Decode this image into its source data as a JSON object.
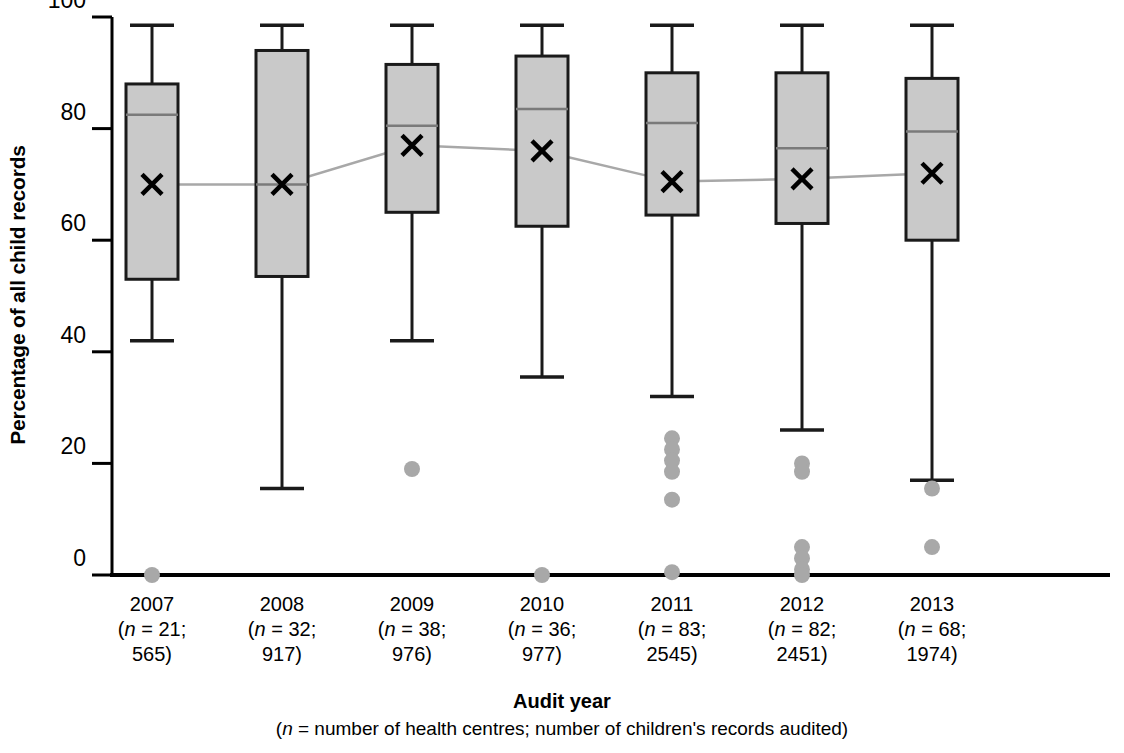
{
  "chart_data": {
    "type": "box",
    "title": "",
    "xlabel": "Audit year",
    "xlabel_note": "(n = number of health centres; number of children's records audited)",
    "ylabel": "Percentage of all child records",
    "ylim": [
      0,
      100
    ],
    "yticks": [
      0,
      20,
      40,
      60,
      80,
      100
    ],
    "ytick_labels": [
      "0",
      "20",
      "40",
      "60",
      "80",
      "100"
    ],
    "grid": false,
    "legend": "none",
    "colors": {
      "box_fill": "#c9c9c9",
      "box_edge": "#1a1a1a",
      "median_line": "#7a7a7a",
      "mean_marker": "#000000",
      "mean_connector": "#a8a8a8",
      "outlier": "#a8a8a8",
      "axis": "#000000"
    },
    "categories": [
      "2007",
      "2008",
      "2009",
      "2010",
      "2011",
      "2012",
      "2013"
    ],
    "category_sublabels": [
      {
        "line1": "(n = 21;",
        "line2": "565)"
      },
      {
        "line1": "(n = 32;",
        "line2": "917)"
      },
      {
        "line1": "(n = 38;",
        "line2": "976)"
      },
      {
        "line1": "(n = 36;",
        "line2": "977)"
      },
      {
        "line1": "(n = 83;",
        "line2": "2545)"
      },
      {
        "line1": "(n = 82;",
        "line2": "2451)"
      },
      {
        "line1": "(n = 68;",
        "line2": "1974)"
      }
    ],
    "health_centres": [
      21,
      32,
      38,
      36,
      83,
      82,
      68
    ],
    "records_audited": [
      565,
      917,
      976,
      977,
      2545,
      2451,
      1974
    ],
    "boxes": [
      {
        "category": "2007",
        "whisker_low": 42,
        "q1": 53,
        "median": 82.5,
        "q3": 88,
        "whisker_high": 98.5,
        "mean": 70,
        "outliers": [
          0
        ]
      },
      {
        "category": "2008",
        "whisker_low": 15.5,
        "q1": 53.5,
        "median": 70,
        "q3": 94,
        "whisker_high": 98.5,
        "mean": 70,
        "outliers": []
      },
      {
        "category": "2009",
        "whisker_low": 42,
        "q1": 65,
        "median": 80.5,
        "q3": 91.5,
        "whisker_high": 98.5,
        "mean": 77,
        "outliers": [
          19
        ]
      },
      {
        "category": "2010",
        "whisker_low": 35.5,
        "q1": 62.5,
        "median": 83.5,
        "q3": 93,
        "whisker_high": 98.5,
        "mean": 76,
        "outliers": [
          0
        ]
      },
      {
        "category": "2011",
        "whisker_low": 32,
        "q1": 64.5,
        "median": 81,
        "q3": 90,
        "whisker_high": 98.5,
        "mean": 70.5,
        "outliers": [
          24.5,
          22.5,
          20.5,
          18.5,
          13.5,
          0.5
        ]
      },
      {
        "category": "2012",
        "whisker_low": 26,
        "q1": 63,
        "median": 76.5,
        "q3": 90,
        "whisker_high": 98.5,
        "mean": 71,
        "outliers": [
          20,
          18.5,
          5,
          3,
          1,
          0
        ]
      },
      {
        "category": "2013",
        "whisker_low": 17,
        "q1": 60,
        "median": 79.5,
        "q3": 89,
        "whisker_high": 98.5,
        "mean": 72,
        "outliers": [
          15.5,
          5
        ]
      }
    ],
    "mean_series": {
      "name": "Mean",
      "values": [
        70,
        70,
        77,
        76,
        70.5,
        71,
        72
      ]
    }
  }
}
